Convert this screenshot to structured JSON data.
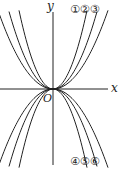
{
  "diagram": {
    "type": "graphs of y = ax^2",
    "axes": {
      "x_label": "x",
      "y_label": "y",
      "origin_label": "O"
    },
    "curves_up": [
      {
        "label": "①",
        "k": 0.068
      },
      {
        "label": "②",
        "k": 0.04
      },
      {
        "label": "③",
        "k": 0.026
      }
    ],
    "curves_down": [
      {
        "label": "④",
        "k": -0.068
      },
      {
        "label": "⑤",
        "k": -0.04
      },
      {
        "label": "⑥",
        "k": -0.026
      }
    ],
    "top_labels": "①②③",
    "bottom_labels": "④⑤⑥",
    "colors": {
      "stroke": "#222222",
      "background": "#ffffff"
    }
  }
}
